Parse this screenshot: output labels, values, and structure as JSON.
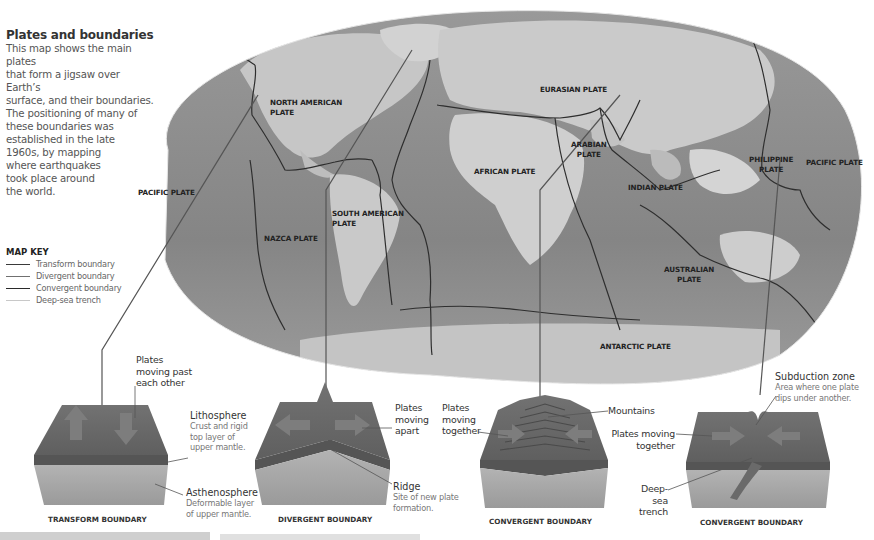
{
  "intro": {
    "title": "Plates and boundaries",
    "lines": [
      "This map shows the main plates",
      "that form a jigsaw over Earth’s",
      "surface, and their boundaries.",
      "The positioning of many of",
      "these boundaries was",
      "established in the late",
      "1960s, by mapping",
      "where earthquakes",
      "took place around",
      "the world."
    ]
  },
  "map_key": {
    "title": "MAP KEY",
    "items": [
      {
        "label": "Transform boundary",
        "color": "#3a3a3a"
      },
      {
        "label": "Divergent boundary",
        "color": "#707070"
      },
      {
        "label": "Convergent boundary",
        "color": "#2a2a2a"
      },
      {
        "label": "Deep-sea trench",
        "color": "#c8c8c8"
      }
    ]
  },
  "plates": {
    "north_american": [
      "NORTH AMERICAN",
      "PLATE"
    ],
    "eurasian": [
      "EURASIAN PLATE"
    ],
    "pacific_west": [
      "PACIFIC PLATE"
    ],
    "african": [
      "AFRICAN PLATE"
    ],
    "arabian": [
      "ARABIAN",
      "PLATE"
    ],
    "south_american": [
      "SOUTH AMERICAN",
      "PLATE"
    ],
    "nazca": [
      "NAZCA PLATE"
    ],
    "indian": [
      "INDIAN PLATE"
    ],
    "philippine": [
      "PHILIPPINE",
      "PLATE"
    ],
    "pacific_east": [
      "PACIFIC PLATE"
    ],
    "australian": [
      "AUSTRALIAN",
      "PLATE"
    ],
    "antarctic": [
      "ANTARCTIC PLATE"
    ]
  },
  "diagrams": {
    "transform": {
      "caption": "TRANSFORM BOUNDARY",
      "motion": [
        "Plates",
        "moving past",
        "each other"
      ],
      "lithosphere_title": "Lithosphere",
      "lithosphere_desc": [
        "Crust and rigid",
        "top layer of",
        "upper mantle."
      ],
      "asthenosphere_title": "Asthenosphere",
      "asthenosphere_desc": [
        "Deformable layer",
        "of upper mantle."
      ]
    },
    "divergent": {
      "caption": "DIVERGENT BOUNDARY",
      "motion": [
        "Plates",
        "moving",
        "apart"
      ],
      "ridge_title": "Ridge",
      "ridge_desc": [
        "Site of new plate",
        "formation."
      ]
    },
    "convergent_mountains": {
      "caption": "CONVERGENT BOUNDARY",
      "motion": [
        "Plates",
        "moving",
        "together"
      ],
      "mountains": "Mountains"
    },
    "convergent_subduction": {
      "caption": "CONVERGENT BOUNDARY",
      "subduction_title": "Subduction zone",
      "subduction_desc": [
        "Area where one plate",
        "dips under another."
      ],
      "motion": [
        "Plates moving",
        "together"
      ],
      "trench": [
        "Deep-sea",
        "trench"
      ]
    }
  },
  "colors": {
    "ocean": "#8f8f8f",
    "land": "#c9c9c9",
    "boundary": "#2e2e2e",
    "block_top": "#6e6e6e",
    "block_side": "#a8a8a8"
  }
}
